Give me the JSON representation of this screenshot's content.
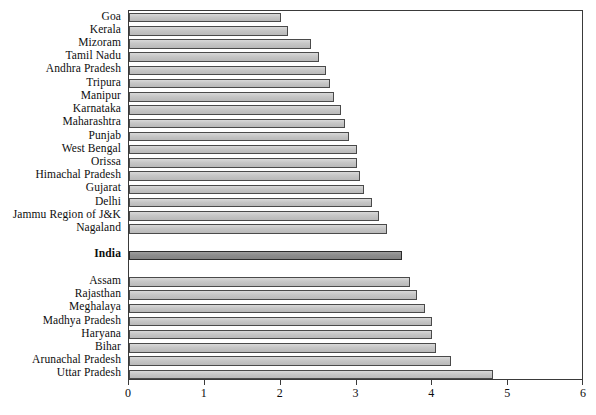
{
  "chart_data": {
    "type": "bar",
    "orientation": "horizontal",
    "title": "",
    "subtitle": "",
    "xlabel": "",
    "ylabel": "",
    "xlim": [
      0,
      6
    ],
    "ylim": null,
    "grid": false,
    "legend": null,
    "xticks": [
      0,
      1,
      2,
      3,
      4,
      5,
      6
    ],
    "xtick_labels": [
      "0",
      "1",
      "2",
      "3",
      "4",
      "5",
      "6"
    ],
    "highlight_category": "India",
    "colors": {
      "bar_fill": "#c6c6c6",
      "bar_edge": "#4a4a4a",
      "highlight_fill": "#8c8c8c",
      "highlight_edge": "#2b2b2b",
      "axis": "#3a3a3a",
      "text": "#0d0d0d",
      "background": "#ffffff"
    },
    "categories": [
      "Goa",
      "Kerala",
      "Mizoram",
      "Tamil Nadu",
      "Andhra Pradesh",
      "Tripura",
      "Manipur",
      "Karnataka",
      "Maharashtra",
      "Punjab",
      "West Bengal",
      "Orissa",
      "Himachal Pradesh",
      "Gujarat",
      "Delhi",
      "Jammu Region of J&K",
      "Nagaland",
      "India",
      "Assam",
      "Rajasthan",
      "Meghalaya",
      "Madhya Pradesh",
      "Haryana",
      "Bihar",
      "Arunachal Pradesh",
      "Uttar Pradesh"
    ],
    "values": [
      2.0,
      2.1,
      2.4,
      2.5,
      2.6,
      2.65,
      2.7,
      2.8,
      2.85,
      2.9,
      3.0,
      3.0,
      3.05,
      3.1,
      3.2,
      3.3,
      3.4,
      3.6,
      3.7,
      3.8,
      3.9,
      4.0,
      4.0,
      4.05,
      4.25,
      4.8
    ],
    "bars": [
      {
        "label": "Goa",
        "value": 2.0,
        "highlight": false
      },
      {
        "label": "Kerala",
        "value": 2.1,
        "highlight": false
      },
      {
        "label": "Mizoram",
        "value": 2.4,
        "highlight": false
      },
      {
        "label": "Tamil Nadu",
        "value": 2.5,
        "highlight": false
      },
      {
        "label": "Andhra Pradesh",
        "value": 2.6,
        "highlight": false
      },
      {
        "label": "Tripura",
        "value": 2.65,
        "highlight": false
      },
      {
        "label": "Manipur",
        "value": 2.7,
        "highlight": false
      },
      {
        "label": "Karnataka",
        "value": 2.8,
        "highlight": false
      },
      {
        "label": "Maharashtra",
        "value": 2.85,
        "highlight": false
      },
      {
        "label": "Punjab",
        "value": 2.9,
        "highlight": false
      },
      {
        "label": "West Bengal",
        "value": 3.0,
        "highlight": false
      },
      {
        "label": "Orissa",
        "value": 3.0,
        "highlight": false
      },
      {
        "label": "Himachal Pradesh",
        "value": 3.05,
        "highlight": false
      },
      {
        "label": "Gujarat",
        "value": 3.1,
        "highlight": false
      },
      {
        "label": "Delhi",
        "value": 3.2,
        "highlight": false
      },
      {
        "label": "Jammu Region of J&K",
        "value": 3.3,
        "highlight": false
      },
      {
        "label": "Nagaland",
        "value": 3.4,
        "highlight": false
      },
      {
        "label": "India",
        "value": 3.6,
        "highlight": true
      },
      {
        "label": "Assam",
        "value": 3.7,
        "highlight": false
      },
      {
        "label": "Rajasthan",
        "value": 3.8,
        "highlight": false
      },
      {
        "label": "Meghalaya",
        "value": 3.9,
        "highlight": false
      },
      {
        "label": "Madhya Pradesh",
        "value": 4.0,
        "highlight": false
      },
      {
        "label": "Haryana",
        "value": 4.0,
        "highlight": false
      },
      {
        "label": "Bihar",
        "value": 4.05,
        "highlight": false
      },
      {
        "label": "Arunachal Pradesh",
        "value": 4.25,
        "highlight": false
      },
      {
        "label": "Uttar Pradesh",
        "value": 4.8,
        "highlight": false
      }
    ]
  }
}
